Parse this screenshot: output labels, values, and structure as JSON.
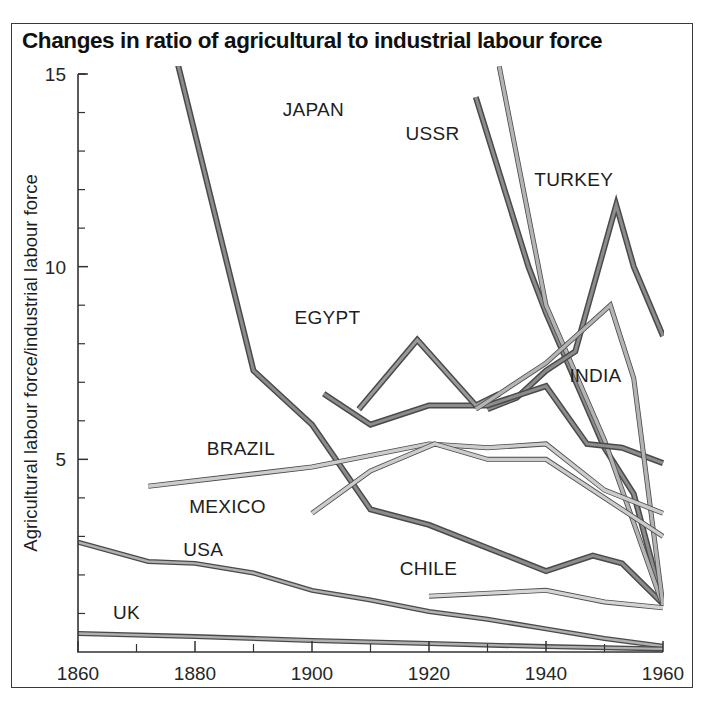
{
  "chart_data": {
    "type": "line",
    "title": "Changes in ratio of agricultural to industrial labour force",
    "xlabel": "",
    "ylabel": "Agricultural labour force/industrial labour force",
    "xlim": [
      1860,
      1960
    ],
    "ylim": [
      0,
      15
    ],
    "xticks": [
      1860,
      1880,
      1900,
      1920,
      1940,
      1960
    ],
    "xtick_labels": [
      "1860",
      "1880",
      "1900",
      "1920",
      "1940",
      "1960"
    ],
    "xminor_step": 10,
    "yticks": [
      5,
      10,
      15
    ],
    "ytick_labels": [
      "5",
      "10",
      "15"
    ],
    "yminor_step": 1,
    "grid": false,
    "legend": "inline-labels",
    "series": [
      {
        "name": "JAPAN",
        "label": "JAPAN",
        "color": "#8c8c8c",
        "weight": "heavy",
        "label_x": 1895,
        "label_y": 13.9,
        "points": [
          [
            1877,
            15.3
          ],
          [
            1890,
            7.3
          ],
          [
            1900,
            5.9
          ],
          [
            1910,
            3.7
          ],
          [
            1920,
            3.3
          ],
          [
            1930,
            2.7
          ],
          [
            1940,
            2.1
          ],
          [
            1948,
            2.5
          ],
          [
            1953,
            2.3
          ],
          [
            1960,
            1.25
          ]
        ]
      },
      {
        "name": "USSR",
        "label": "USSR",
        "color": "#8c8c8c",
        "weight": "heavy",
        "label_x": 1916,
        "label_y": 13.3,
        "points": [
          [
            1928,
            14.4
          ],
          [
            1937,
            10.0
          ],
          [
            1940,
            8.8
          ],
          [
            1950,
            5.3
          ],
          [
            1955,
            4.1
          ],
          [
            1960,
            1.25
          ]
        ]
      },
      {
        "name": "USSR",
        "label": "",
        "color": "#b4b4b4",
        "weight": "light",
        "label_x": 0,
        "label_y": 0,
        "points": [
          [
            1932,
            15.2
          ],
          [
            1940,
            9.0
          ],
          [
            1950,
            5.5
          ],
          [
            1960,
            1.2
          ]
        ]
      },
      {
        "name": "TURKEY",
        "label": "TURKEY",
        "color": "#8c8c8c",
        "weight": "heavy",
        "label_x": 1938,
        "label_y": 12.1,
        "points": [
          [
            1930,
            6.3
          ],
          [
            1935,
            6.6
          ],
          [
            1940,
            7.3
          ],
          [
            1945,
            7.8
          ],
          [
            1952,
            11.6
          ],
          [
            1955,
            10.0
          ],
          [
            1960,
            8.2
          ]
        ]
      },
      {
        "name": "EGYPT",
        "label": "EGYPT",
        "color": "#8c8c8c",
        "weight": "heavy",
        "label_x": 1897,
        "label_y": 8.5,
        "points": [
          [
            1902,
            6.7
          ],
          [
            1910,
            5.9
          ],
          [
            1920,
            6.4
          ],
          [
            1930,
            6.4
          ],
          [
            1940,
            6.9
          ],
          [
            1947,
            5.4
          ],
          [
            1953,
            5.3
          ],
          [
            1960,
            4.9
          ]
        ]
      },
      {
        "name": "EGYPT-peak",
        "label": "",
        "color": "#9a9a9a",
        "weight": "heavy",
        "label_x": 0,
        "label_y": 0,
        "points": [
          [
            1908,
            6.3
          ],
          [
            1918,
            8.1
          ],
          [
            1928,
            6.4
          ],
          [
            1932,
            6.7
          ]
        ]
      },
      {
        "name": "INDIA",
        "label": "INDIA",
        "color": "#b4b4b4",
        "weight": "light",
        "label_x": 1944,
        "label_y": 7.0,
        "points": [
          [
            1928,
            6.3
          ],
          [
            1940,
            7.5
          ],
          [
            1951,
            9.0
          ],
          [
            1955,
            7.1
          ],
          [
            1960,
            1.2
          ]
        ]
      },
      {
        "name": "BRAZIL",
        "label": "BRAZIL",
        "color": "#cccccc",
        "weight": "light",
        "label_x": 1882,
        "label_y": 5.1,
        "points": [
          [
            1872,
            4.3
          ],
          [
            1900,
            4.8
          ],
          [
            1920,
            5.4
          ],
          [
            1930,
            5.3
          ],
          [
            1940,
            5.4
          ],
          [
            1950,
            4.2
          ],
          [
            1960,
            3.6
          ]
        ]
      },
      {
        "name": "MEXICO",
        "label": "MEXICO",
        "color": "#cccccc",
        "weight": "light",
        "label_x": 1879,
        "label_y": 3.6,
        "points": [
          [
            1900,
            3.6
          ],
          [
            1910,
            4.7
          ],
          [
            1921,
            5.4
          ],
          [
            1930,
            5.0
          ],
          [
            1940,
            5.0
          ],
          [
            1950,
            4.0
          ],
          [
            1960,
            3.0
          ]
        ]
      },
      {
        "name": "CHILE",
        "label": "CHILE",
        "color": "#d4d4d4",
        "weight": "light",
        "label_x": 1915,
        "label_y": 2.0,
        "points": [
          [
            1920,
            1.45
          ],
          [
            1940,
            1.6
          ],
          [
            1950,
            1.3
          ],
          [
            1960,
            1.15
          ]
        ]
      },
      {
        "name": "USA",
        "label": "USA",
        "color": "#b0b0b0",
        "weight": "medium",
        "label_x": 1878,
        "label_y": 2.5,
        "points": [
          [
            1860,
            2.85
          ],
          [
            1872,
            2.35
          ],
          [
            1880,
            2.3
          ],
          [
            1890,
            2.05
          ],
          [
            1900,
            1.6
          ],
          [
            1910,
            1.35
          ],
          [
            1920,
            1.05
          ],
          [
            1930,
            0.85
          ],
          [
            1940,
            0.6
          ],
          [
            1950,
            0.35
          ],
          [
            1960,
            0.15
          ]
        ]
      },
      {
        "name": "UK",
        "label": "UK",
        "color": "#b0b0b0",
        "weight": "medium",
        "label_x": 1866,
        "label_y": 0.85,
        "points": [
          [
            1860,
            0.48
          ],
          [
            1880,
            0.4
          ],
          [
            1900,
            0.3
          ],
          [
            1920,
            0.22
          ],
          [
            1940,
            0.14
          ],
          [
            1960,
            0.08
          ]
        ]
      }
    ]
  },
  "axes": {
    "y_title": "Agricultural labour force/industrial labour force"
  }
}
